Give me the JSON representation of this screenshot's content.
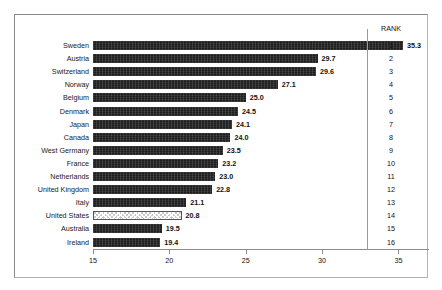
{
  "chart_data": {
    "type": "bar",
    "orientation": "horizontal",
    "title": "",
    "subtitle": "",
    "xlabel": "",
    "ylabel": "",
    "xlim": [
      15,
      37
    ],
    "grid": false,
    "legend_position": "none",
    "xticks": [
      15,
      20,
      25,
      30,
      35
    ],
    "xtick_labels": [
      "15",
      "20",
      "25",
      "30",
      "35"
    ],
    "categories": [
      "Sweden",
      "Austria",
      "Switzerland",
      "Norway",
      "Belgium",
      "Denmark",
      "Japan",
      "Canada",
      "West Germany",
      "France",
      "Netherlands",
      "United Kingdom",
      "Italy",
      "United States",
      "Australia",
      "Ireland"
    ],
    "values": [
      35.3,
      29.7,
      29.6,
      27.1,
      25.0,
      24.5,
      24.1,
      24.0,
      23.5,
      23.2,
      23.0,
      22.8,
      21.1,
      20.8,
      19.5,
      19.4
    ],
    "value_labels": [
      "35.3",
      "29.7",
      "29.6",
      "27.1",
      "25.0",
      "24.5",
      "24.1",
      "24.0",
      "23.5",
      "23.2",
      "23.0",
      "22.8",
      "21.1",
      "20.8",
      "19.5",
      "19.4"
    ],
    "ranks": [
      "1",
      "2",
      "3",
      "4",
      "5",
      "6",
      "7",
      "8",
      "9",
      "10",
      "11",
      "12",
      "13",
      "14",
      "15",
      "16"
    ],
    "highlight_index": 13,
    "colors": {
      "bar": "#1e1e1e",
      "bar_highlight": "#c9c9c9",
      "text": "#111111",
      "axis": "#8c8c8c",
      "frame": "#8a8a8a",
      "background": "#ffffff"
    }
  },
  "rank_column": {
    "header": "RANK"
  }
}
